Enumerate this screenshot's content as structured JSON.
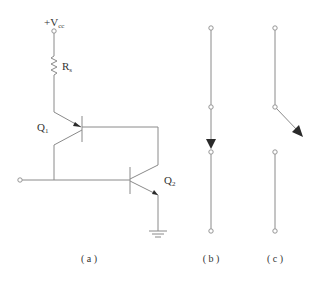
{
  "diagram": {
    "type": "circuit-schematic",
    "panels": [
      {
        "id": "a",
        "caption": "( a )",
        "labels": {
          "supply": "+V",
          "supply_sub": "cc",
          "resistor": "R",
          "resistor_sub": "s",
          "q1": "Q",
          "q1_sub": "1",
          "q2": "Q",
          "q2_sub": "2"
        },
        "components": [
          "supply-terminal",
          "resistor-Rs",
          "pnp-transistor-Q1",
          "npn-transistor-Q2",
          "input-terminal",
          "ground"
        ]
      },
      {
        "id": "b",
        "caption": "( b )",
        "description": "closed switch — vertical line with downward arrow between terminals"
      },
      {
        "id": "c",
        "caption": "( c )",
        "description": "open switch — arrow deflected to the right, line broken"
      }
    ],
    "colors": {
      "wire": "#8a8a8a",
      "arrow": "#2a2a2a",
      "text": "#333333",
      "background": "#ffffff"
    }
  }
}
